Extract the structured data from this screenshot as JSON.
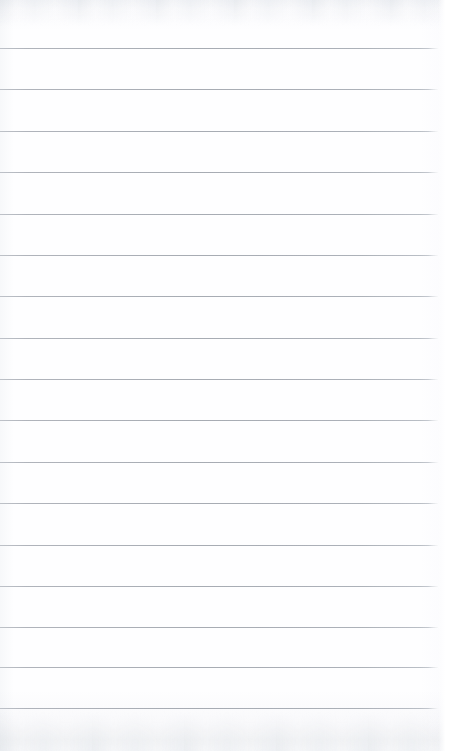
{
  "document": {
    "kind": "scanned-blank-ruled-page",
    "page_label": "",
    "body_text": "",
    "visible_text": ""
  },
  "canvas": {
    "width": 450,
    "height": 751
  },
  "paper": {
    "background_color": "#ffffff",
    "tint_color": "#fafbfc",
    "edge_shade_color": "#f2f3f4"
  },
  "ruling": {
    "line_color": "#a4a9b1",
    "line_thickness_px": 1,
    "first_line_y": 48,
    "line_spacing_px": 41.4,
    "line_start_x": 0,
    "line_end_x": 438,
    "line_count": 17,
    "lines": [
      {
        "index": 1,
        "y": 48,
        "x_start": 0,
        "x_end": 438,
        "content": ""
      },
      {
        "index": 2,
        "y": 89,
        "x_start": 0,
        "x_end": 438,
        "content": ""
      },
      {
        "index": 3,
        "y": 131,
        "x_start": 0,
        "x_end": 438,
        "content": ""
      },
      {
        "index": 4,
        "y": 172,
        "x_start": 0,
        "x_end": 438,
        "content": ""
      },
      {
        "index": 5,
        "y": 214,
        "x_start": 0,
        "x_end": 438,
        "content": ""
      },
      {
        "index": 6,
        "y": 255,
        "x_start": 0,
        "x_end": 438,
        "content": ""
      },
      {
        "index": 7,
        "y": 296,
        "x_start": 0,
        "x_end": 438,
        "content": ""
      },
      {
        "index": 8,
        "y": 338,
        "x_start": 0,
        "x_end": 438,
        "content": ""
      },
      {
        "index": 9,
        "y": 379,
        "x_start": 0,
        "x_end": 438,
        "content": ""
      },
      {
        "index": 10,
        "y": 420,
        "x_start": 0,
        "x_end": 438,
        "content": ""
      },
      {
        "index": 11,
        "y": 462,
        "x_start": 0,
        "x_end": 438,
        "content": ""
      },
      {
        "index": 12,
        "y": 503,
        "x_start": 0,
        "x_end": 438,
        "content": ""
      },
      {
        "index": 13,
        "y": 545,
        "x_start": 0,
        "x_end": 438,
        "content": ""
      },
      {
        "index": 14,
        "y": 586,
        "x_start": 0,
        "x_end": 438,
        "content": ""
      },
      {
        "index": 15,
        "y": 627,
        "x_start": 0,
        "x_end": 438,
        "content": ""
      },
      {
        "index": 16,
        "y": 667,
        "x_start": 0,
        "x_end": 438,
        "content": ""
      },
      {
        "index": 17,
        "y": 708,
        "x_start": 0,
        "x_end": 438,
        "content": ""
      }
    ]
  },
  "margins": {
    "top_margin_px": 48,
    "bottom_margin_px": 43,
    "right_margin_px": 12,
    "left_margin_px": 0
  },
  "artifacts": {
    "top_scan_band": true,
    "bottom_scan_band": true,
    "vertical_margin_rule": false,
    "handwriting": false
  }
}
